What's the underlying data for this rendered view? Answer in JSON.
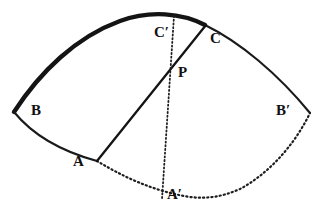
{
  "figure": {
    "type": "geometry-diagram",
    "background_color": "#ffffff",
    "ink_color": "#111111",
    "canvas": {
      "width": 330,
      "height": 221
    }
  },
  "points": [
    {
      "id": "B",
      "label": "B",
      "x": 14,
      "y": 112,
      "label_x": 31,
      "label_y": 104,
      "role": "left-vertex"
    },
    {
      "id": "Bp",
      "label": "B",
      "prime": "′",
      "x": 310,
      "y": 113,
      "label_x": 276,
      "label_y": 104,
      "role": "right-vertex"
    },
    {
      "id": "A",
      "label": "A",
      "x": 97,
      "y": 160,
      "label_x": 74,
      "label_y": 155,
      "role": "lower-arc-point"
    },
    {
      "id": "Ap",
      "label": "A",
      "prime": "′",
      "x": 163,
      "y": 198,
      "label_x": 167,
      "label_y": 188,
      "role": "bottom-arc-point"
    },
    {
      "id": "C",
      "label": "C",
      "x": 205,
      "y": 25,
      "label_x": 210,
      "label_y": 32,
      "role": "upper-arc-point"
    },
    {
      "id": "Cp",
      "label": "C",
      "prime": "′",
      "x": 172,
      "y": 17,
      "label_x": 155,
      "label_y": 26,
      "role": "top-arc-point"
    },
    {
      "id": "P",
      "label": "P",
      "x": 172,
      "y": 62,
      "label_x": 178,
      "label_y": 66,
      "role": "intersection"
    }
  ],
  "strokes": {
    "arc_top_bold": {
      "name": "arc-B-to-C",
      "style": "solid",
      "weight": 4.0,
      "from": "B",
      "to": "C"
    },
    "arc_top_thin": {
      "name": "arc-C-to-Bprime",
      "style": "solid",
      "weight": 2.0,
      "from": "C",
      "to": "Bp"
    },
    "arc_bottom_solid": {
      "name": "arc-B-to-A",
      "style": "solid",
      "weight": 2.0,
      "from": "B",
      "to": "A"
    },
    "arc_bottom_dotted": {
      "name": "arc-A-to-Bprime",
      "style": "dotted",
      "weight": 2.0,
      "from": "A",
      "to": "Bp"
    },
    "chord_solid": {
      "name": "chord-A-to-C",
      "style": "solid",
      "weight": 2.0,
      "from": "A",
      "to": "C"
    },
    "chord_dotted": {
      "name": "chord-Cprime-to-Aprime",
      "style": "dotted",
      "weight": 1.6,
      "from": "Cp",
      "to": "Ap"
    }
  },
  "geometry": {
    "top_arc_path": "M 14 112 Q 70 32 118 19 Q 160 9 205 25 Q 262 48 310 113",
    "top_arc_bold_path": "M 14 112 Q 70 32 118 19 Q 160 9 205 25",
    "top_arc_thin_path": "M 205 25 Q 262 48 310 113",
    "bottom_arc_solid_path": "M 14 112 Q 48 143 97 160",
    "bottom_arc_dotted_path": "M 97 160 Q 128 172 163 198 Q 163 198 170 201 Q 240 196 310 113",
    "bottom_arc_dotted_path_b": "M 97 160 Q 140 200 200 203 Q 264 200 310 113",
    "chord_solid_line": {
      "x1": 97,
      "y1": 160,
      "x2": 205,
      "y2": 25
    },
    "chord_dotted_line": {
      "x1": 172,
      "y1": 17,
      "x2": 163,
      "y2": 198
    }
  }
}
